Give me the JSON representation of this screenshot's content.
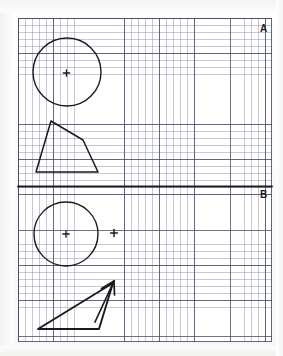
{
  "document": {
    "type": "graph-paper-worksheet",
    "title": "Graph paper transformation worksheet",
    "background_color": "#ffffff",
    "ink_color": "#1a1a1a",
    "grid": {
      "minor_color": "#787d96",
      "major_color": "#464b69",
      "minor_spacing_px": 7.06,
      "major_every_n_cells": 5,
      "left_px": 18,
      "top_px": 18,
      "width_px": 254,
      "height_px": 324
    }
  },
  "labels": {
    "region_a": "A",
    "region_b": "B"
  },
  "divider": {
    "name": "line-of-reflection",
    "orientation": "horizontal",
    "y_px": 186,
    "x_start_px": 18,
    "x_end_px": 272,
    "stroke_width_px": 1.8,
    "color": "#1a1a1a"
  },
  "shapes": [
    {
      "name": "circle-upper",
      "type": "circle",
      "region": "A",
      "cx_px": 67,
      "cy_px": 72,
      "r_px": 34,
      "stroke_width_px": 1.4
    },
    {
      "name": "center-mark-upper-circle",
      "type": "cross-point",
      "region": "A",
      "cx_px": 66.5,
      "cy_px": 73,
      "arm_px": 3.2,
      "stroke_width_px": 1.3
    },
    {
      "name": "quadrilateral-upper",
      "type": "polygon",
      "region": "A",
      "closed": true,
      "points_px": [
        [
          51,
          121
        ],
        [
          83,
          140
        ],
        [
          98,
          172
        ],
        [
          36,
          172
        ]
      ],
      "stroke_width_px": 1.5
    },
    {
      "name": "circle-lower",
      "type": "circle",
      "region": "B",
      "cx_px": 66,
      "cy_px": 234,
      "r_px": 32,
      "stroke_width_px": 1.4
    },
    {
      "name": "center-mark-lower-circle",
      "type": "cross-point",
      "region": "B",
      "cx_px": 66,
      "cy_px": 234,
      "arm_px": 3.2,
      "stroke_width_px": 1.3
    },
    {
      "name": "image-center-mark",
      "type": "cross-point",
      "region": "B",
      "cx_px": 114,
      "cy_px": 233,
      "arm_px": 3.4,
      "stroke_width_px": 1.4
    },
    {
      "name": "triangle-lower",
      "type": "polygon",
      "region": "B",
      "closed": true,
      "points_px": [
        [
          38,
          329
        ],
        [
          113,
          283
        ],
        [
          99,
          329
        ]
      ],
      "stroke_width_px": 1.8
    },
    {
      "name": "arrow-vector",
      "type": "arrow",
      "region": "B",
      "tail_px": [
        95,
        322
      ],
      "tip_px": [
        114,
        281
      ],
      "barb_left_px": [
        101,
        288
      ],
      "barb_right_px": [
        114,
        294
      ],
      "stroke_width_px": 1.6
    }
  ]
}
